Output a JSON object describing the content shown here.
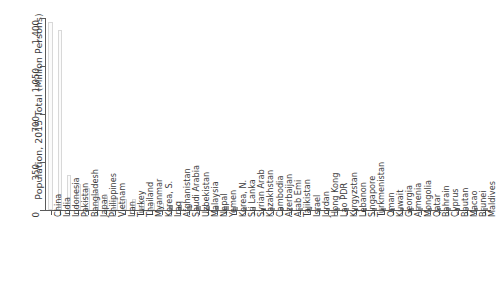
{
  "chart_data": {
    "type": "bar",
    "title": "",
    "subtitle": "",
    "xlabel": "",
    "ylabel": "Population, 2015 Total (Million Persons)",
    "ylim": [
      0,
      1400
    ],
    "yticks": [
      0,
      350,
      700,
      1050,
      1400
    ],
    "ytick_labels": [
      "0",
      "350",
      "700",
      "1,050",
      "1,400"
    ],
    "grid": false,
    "legend": null,
    "orientation": "vertical",
    "sort": "descending",
    "bar_colors": {
      "light_fill": "#fbfbfb",
      "light_edge": "#d8d8d8",
      "dark_fill": "#a8a8a8",
      "dark_edge": "#9a9a9a"
    },
    "axis_color": "#5a5a5a",
    "text_color": "#3c3c3c",
    "background": "#ffffff",
    "categories": [
      "China",
      "India",
      "Indonesia",
      "Pakistan",
      "Bangladesh",
      "Japan",
      "Philippines",
      "Vietnam",
      "Iran",
      "Turkey",
      "Thailand",
      "Myanmar",
      "Korea, S.",
      "Iraq",
      "Afghanistan",
      "Saudi Arabia",
      "Uzbekistan",
      "Malaysia",
      "Nepal",
      "Yemen",
      "Korea, N.",
      "Sri Lanka",
      "Syrian Arab",
      "Kazakhstan",
      "Cambodia",
      "Azerbaijan",
      "Arab Emi",
      "Tajikistan",
      "Israel",
      "Jordan",
      "Hong Kong",
      "Lao PDR",
      "Kyrgyzstan",
      "Lebanon",
      "Singapore",
      "Turkmenistan",
      "Oman",
      "Kuwait",
      "Georgia",
      "Armenia",
      "Mongolia",
      "Qatar",
      "Bahrain",
      "Cyprus",
      "Bhutan",
      "Macao",
      "Brunei",
      "Maldives"
    ],
    "values": [
      1371,
      1311,
      258,
      189,
      161,
      127,
      101,
      92,
      79,
      78,
      68,
      54,
      51,
      36,
      33,
      32,
      31,
      31,
      28,
      26,
      25,
      21,
      19,
      18,
      16,
      10,
      9.2,
      8.5,
      8.4,
      7.6,
      7.3,
      6.8,
      6.0,
      5.9,
      5.5,
      5.4,
      4.5,
      3.9,
      3.7,
      3.0,
      3.0,
      2.5,
      1.4,
      1.2,
      0.8,
      0.6,
      0.4,
      0.4
    ],
    "value_unit": "Million Persons",
    "light_bar_count": 13
  }
}
